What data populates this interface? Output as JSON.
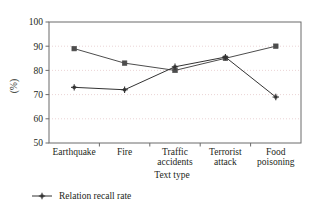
{
  "chart_data": {
    "type": "line",
    "title": "",
    "xlabel": "Text type",
    "ylabel": "(%)",
    "ylim": [
      50,
      100
    ],
    "yticks": [
      50,
      60,
      70,
      80,
      90,
      100
    ],
    "grid": true,
    "legend_position": "bottom-left",
    "categories": [
      "Earthquake",
      "Fire",
      "Traffic accidents",
      "Terrorist attack",
      "Food poisoning"
    ],
    "category_lines": [
      [
        "Earthquake"
      ],
      [
        "Fire"
      ],
      [
        "Traffic",
        "accidents"
      ],
      [
        "Terrorist",
        "attack"
      ],
      [
        "Food",
        "poisoning"
      ]
    ],
    "series": [
      {
        "name": "",
        "marker": "square",
        "color": "#4d4d4d",
        "values": [
          89,
          83,
          80,
          85,
          90
        ]
      },
      {
        "name": "Relation recall rate",
        "marker": "plus",
        "color": "#333333",
        "values": [
          73,
          72,
          81.5,
          85.5,
          69
        ]
      }
    ]
  },
  "legend": {
    "items": [
      {
        "label": "Relation recall rate",
        "marker": "plus",
        "color": "#333333"
      }
    ]
  },
  "style": {
    "grid_color": "#e8cfd0",
    "axis_color": "#6b6b6b",
    "background": "#ffffff"
  }
}
